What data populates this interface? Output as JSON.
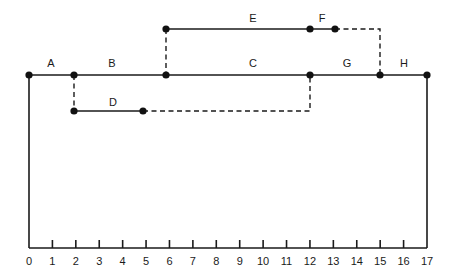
{
  "diagram": {
    "type": "activity-network-time-scaled",
    "axis": {
      "ticks": [
        "0",
        "1",
        "2",
        "3",
        "4",
        "5",
        "6",
        "7",
        "8",
        "9",
        "10",
        "11",
        "12",
        "13",
        "14",
        "15",
        "16",
        "17"
      ],
      "min": 0,
      "max": 17
    },
    "activities": [
      {
        "label": "A",
        "start": 0,
        "end": 2,
        "row": "main"
      },
      {
        "label": "B",
        "start": 2,
        "end": 6,
        "row": "main"
      },
      {
        "label": "C",
        "start": 6,
        "end": 12.4,
        "row": "main"
      },
      {
        "label": "G",
        "start": 12.4,
        "end": 15.4,
        "row": "main"
      },
      {
        "label": "H",
        "start": 15.4,
        "end": 17,
        "row": "main"
      },
      {
        "label": "D",
        "start": 2,
        "end": 5,
        "row": "lower",
        "float_to": 12.4
      },
      {
        "label": "E",
        "start": 6,
        "end": 12.4,
        "row": "upper"
      },
      {
        "label": "F",
        "start": 12.4,
        "end": 13.5,
        "row": "upper",
        "float_to": 15.4
      }
    ],
    "colors": {
      "line": "#1a1a1a",
      "background": "#ffffff"
    }
  }
}
